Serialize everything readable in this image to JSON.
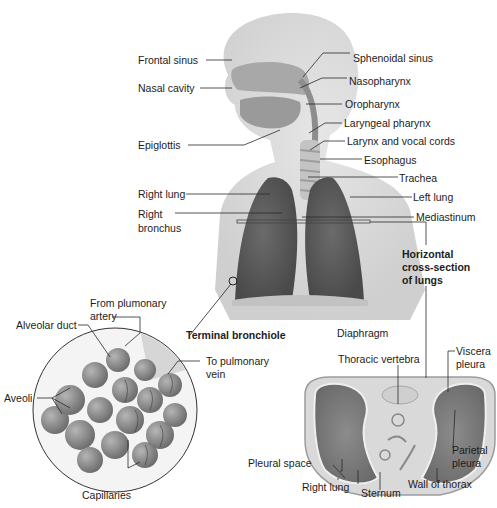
{
  "diagram": {
    "head_labels_left": {
      "frontal_sinus": "Frontal  sinus",
      "nasal_cavity": "Nasal cavity",
      "epiglottis": "Epiglottis"
    },
    "head_labels_right": {
      "sphenoidal_sinus": "Sphenoidal sinus",
      "nasopharynx": "Nasopharynx",
      "oropharynx": "Oropharynx",
      "laryngeal_pharynx": "Laryngeal pharynx",
      "larynx": "Larynx and vocal cords",
      "esophagus": "Esophagus",
      "trachea": "Trachea"
    },
    "chest_labels": {
      "right_lung": "Right lung",
      "right_bronchus_1": "Right",
      "right_bronchus_2": "bronchus",
      "left_lung": "Left lung",
      "mediastinum": "Mediastinum",
      "diaphragm": "Diaphragm"
    },
    "cross_section_title": {
      "line1": "Horizontal",
      "line2": "cross-section",
      "line3": "of lungs"
    },
    "alveoli_inset": {
      "terminal_bronchiole": "Terminal bronchiole",
      "from_artery_1": "From plumonary",
      "from_artery_2": "artery",
      "alveolar_duct": "Alveolar duct",
      "to_vein_1": "To pulmonary",
      "to_vein_2": "vein",
      "aveoli": "Aveoli",
      "capillaries": "Capillaries"
    },
    "cross_section_labels": {
      "thoracic_vertebra": "Thoracic vertebra",
      "viscera_pleura_1": "Viscera",
      "viscera_pleura_2": "pleura",
      "parietal_pleura_1": "Parietal",
      "parietal_pleura_2": "pleura",
      "pleural_space": "Pleural space",
      "right_lung": "Right lung",
      "sternum": "Sternum",
      "wall_of_thorax": "Wall of thorax"
    },
    "colors": {
      "skin": "#dcdcdc",
      "lung": "#5e5e5e",
      "airway": "#bdbdbd",
      "alveolus": "#8a8a8a",
      "text": "#1c1c1c"
    }
  }
}
